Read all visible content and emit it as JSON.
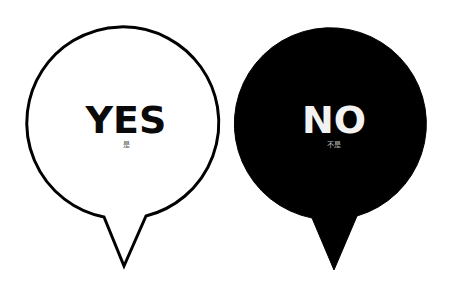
{
  "bubbles": [
    {
      "id": "yes",
      "title": "YES",
      "subtitle": "是",
      "style": "outline",
      "fill": "#ffffff",
      "stroke": "#000000",
      "text_color": "#0a0a0a"
    },
    {
      "id": "no",
      "title": "NO",
      "subtitle": "不是",
      "style": "filled",
      "fill": "#000000",
      "stroke": "#000000",
      "text_color": "#f2f2f2"
    }
  ],
  "background": "#ffffff"
}
